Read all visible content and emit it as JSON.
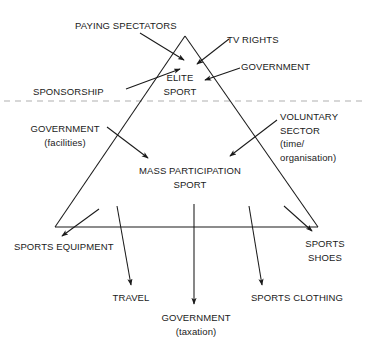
{
  "diagram": {
    "type": "triangle-flow-diagram",
    "colors": {
      "line": "#1a1a1a",
      "text": "#1a1a1a",
      "divider": "#b0b0b0",
      "background": "#ffffff"
    },
    "core_nodes": {
      "elite": {
        "line1": "ELITE",
        "line2": "SPORT"
      },
      "mass": {
        "line1": "MASS PARTICIPATION",
        "line2": "SPORT"
      }
    },
    "inflows_elite": [
      {
        "label": "PAYING SPECTATORS"
      },
      {
        "label": "TV RIGHTS"
      },
      {
        "label": "GOVERNMENT"
      },
      {
        "label": "SPONSORSHIP"
      }
    ],
    "inflows_mass": [
      {
        "line1": "GOVERNMENT",
        "line2": "(facilities)"
      },
      {
        "line1": "VOLUNTARY",
        "line2": "SECTOR",
        "line3": "(time/",
        "line4": "organisation)"
      }
    ],
    "outflows": [
      {
        "label": "SPORTS EQUIPMENT"
      },
      {
        "label": "TRAVEL"
      },
      {
        "line1": "GOVERNMENT",
        "line2": "(taxation)"
      },
      {
        "label": "SPORTS CLOTHING"
      },
      {
        "line1": "SPORTS",
        "line2": "SHOES"
      }
    ],
    "divider": {
      "style": "dashed",
      "y": 101
    }
  }
}
